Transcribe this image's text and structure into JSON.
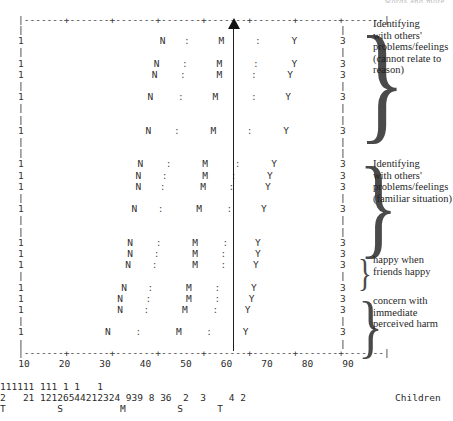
{
  "figure": {
    "top_caption_fragment": "words and more",
    "children_label": "Children",
    "median_value": 60,
    "arrow_name": "median-arrow"
  },
  "chart_data": {
    "type": "line",
    "xlabel": "",
    "ylabel": "",
    "xlim": [
      10,
      90
    ],
    "grid": false,
    "legend": "none",
    "tick_labels": [
      "10",
      "20",
      "30",
      "40",
      "50",
      "60",
      "70",
      "80",
      "90"
    ],
    "tick_values": [
      10,
      20,
      30,
      40,
      50,
      60,
      70,
      80,
      90
    ],
    "axis_rule": "|-------+-------+-------+-------+-------+-------+-------+-------|",
    "median_line_at": 60,
    "symbol_legend": {
      "1": "lower category bound",
      "N": "lower quartile marker",
      ":": "whisker / spread marker",
      "M": "median marker",
      "Y": "upper quartile marker",
      "3": "upper category bound",
      "|": "blank / unmarked row"
    },
    "rows": [
      {
        "kind": "blank",
        "left": "|",
        "right": "|"
      },
      {
        "kind": "data",
        "left": "1",
        "right": "3",
        "N": 45.0,
        "sep1": 51.0,
        "M": 59.5,
        "sep2": 68.5,
        "Y": 77.5
      },
      {
        "kind": "blank",
        "left": "|",
        "right": "|"
      },
      {
        "kind": "data",
        "left": "1",
        "right": "3",
        "N": 43.5,
        "sep1": 50.5,
        "M": 59.0,
        "sep2": 68.0,
        "Y": 77.5
      },
      {
        "kind": "data",
        "left": "1",
        "right": "3",
        "N": 43.0,
        "sep1": 50.0,
        "M": 59.0,
        "sep2": 67.5,
        "Y": 76.5
      },
      {
        "kind": "blank",
        "left": "|",
        "right": "|"
      },
      {
        "kind": "data",
        "left": "1",
        "right": "3",
        "N": 42.0,
        "sep1": 49.5,
        "M": 58.0,
        "sep2": 67.5,
        "Y": 76.0
      },
      {
        "kind": "blank",
        "left": "|",
        "right": "|"
      },
      {
        "kind": "blank",
        "left": "|",
        "right": "|"
      },
      {
        "kind": "data",
        "left": "1",
        "right": "3",
        "N": 41.5,
        "sep1": 48.5,
        "M": 57.5,
        "sep2": 66.5,
        "Y": 75.5
      },
      {
        "kind": "blank",
        "left": "|",
        "right": "|"
      },
      {
        "kind": "blank",
        "left": "|",
        "right": "|"
      },
      {
        "kind": "data",
        "left": "1",
        "right": "3",
        "N": 39.5,
        "sep1": 46.5,
        "M": 55.5,
        "sep2": 63.5,
        "Y": 72.5
      },
      {
        "kind": "data",
        "left": "1",
        "right": "3",
        "N": 39.0,
        "sep1": 45.5,
        "M": 55.5,
        "sep2": 62.5,
        "Y": 71.5
      },
      {
        "kind": "data",
        "left": "1",
        "right": "3",
        "N": 39.0,
        "sep1": 45.0,
        "M": 55.0,
        "sep2": 62.0,
        "Y": 71.0
      },
      {
        "kind": "blank",
        "left": "|",
        "right": "|"
      },
      {
        "kind": "data",
        "left": "1",
        "right": "3",
        "N": 38.0,
        "sep1": 44.5,
        "M": 54.0,
        "sep2": 61.5,
        "Y": 70.0
      },
      {
        "kind": "blank",
        "left": "|",
        "right": "|"
      },
      {
        "kind": "blank",
        "left": "|",
        "right": "|"
      },
      {
        "kind": "data",
        "left": "1",
        "right": "3",
        "N": 37.0,
        "sep1": 44.0,
        "M": 53.0,
        "sep2": 60.5,
        "Y": 68.5
      },
      {
        "kind": "data",
        "left": "1",
        "right": "3",
        "N": 37.0,
        "sep1": 43.5,
        "M": 53.0,
        "sep2": 60.0,
        "Y": 68.5
      },
      {
        "kind": "data",
        "left": "1",
        "right": "3",
        "N": 36.5,
        "sep1": 43.0,
        "M": 53.0,
        "sep2": 60.0,
        "Y": 68.0
      },
      {
        "kind": "blank",
        "left": "|",
        "right": "|"
      },
      {
        "kind": "data",
        "left": "1",
        "right": "3",
        "N": 35.5,
        "sep1": 42.0,
        "M": 51.5,
        "sep2": 58.5,
        "Y": 67.5
      },
      {
        "kind": "data",
        "left": "1",
        "right": "3",
        "N": 34.5,
        "sep1": 41.5,
        "M": 51.5,
        "sep2": 58.5,
        "Y": 67.0
      },
      {
        "kind": "data",
        "left": "1",
        "right": "3",
        "N": 34.5,
        "sep1": 41.0,
        "M": 50.5,
        "sep2": 58.0,
        "Y": 66.0
      },
      {
        "kind": "blank",
        "left": "|",
        "right": "|"
      },
      {
        "kind": "data",
        "left": "1",
        "right": "3",
        "N": 31.5,
        "sep1": 39.0,
        "M": 49.0,
        "sep2": 56.5,
        "Y": 65.5
      },
      {
        "kind": "blank",
        "left": "|",
        "right": "|"
      }
    ],
    "counts": {
      "hundreds_row": "111111 111 1 1   1",
      "units_row": "2   21 12126544212324 939 8 36  2  3    4 2",
      "letters_row": "T         S          M         S      T",
      "letter_markers": [
        "T",
        "S",
        "M",
        "S",
        "T"
      ],
      "letter_meanings": {
        "T": "tail",
        "S": "shoulder",
        "M": "median"
      }
    }
  },
  "annotations": [
    {
      "id": "annot-1",
      "text": "Identifying\nwith others'\nproblems/feelings\n(cannot relate to\n    reason)"
    },
    {
      "id": "annot-2",
      "text": "Identifying\nwith others'\nproblems/feelings\n(familiar situation)"
    },
    {
      "id": "annot-3",
      "text": "happy when\nfriends happy"
    },
    {
      "id": "annot-4",
      "text": "concern with\nimmediate\nperceived harm"
    }
  ]
}
